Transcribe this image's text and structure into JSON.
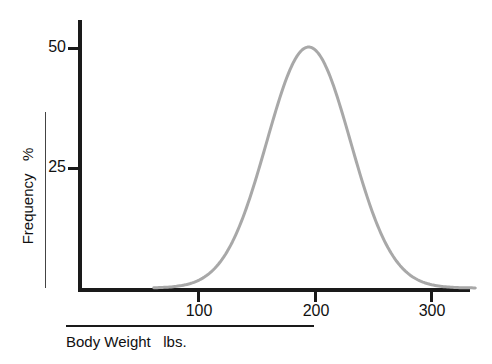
{
  "chart_data": {
    "type": "line",
    "title": "",
    "subtitle": "",
    "xlabel": "Body Weight   lbs.",
    "ylabel": "Frequency   %",
    "xlim": [
      50,
      350
    ],
    "ylim": [
      0,
      56
    ],
    "xticks": [
      100,
      200,
      300
    ],
    "yticks": [
      25,
      50
    ],
    "xtick_labels": [
      "100",
      "200",
      "300"
    ],
    "ytick_labels": [
      "25",
      "50"
    ],
    "grid": false,
    "legend": false,
    "legend_position": "none",
    "annotations": [],
    "series": [
      {
        "name": "Body weight distribution",
        "color": "#a8a8a8",
        "linewidth": 3,
        "x": [
          70,
          80,
          90,
          100,
          110,
          120,
          130,
          140,
          150,
          160,
          170,
          180,
          190,
          200,
          210,
          220,
          230,
          240,
          250,
          260,
          270,
          280,
          290,
          300,
          310,
          320,
          330
        ],
        "values": [
          0.1,
          0.4,
          1.2,
          3.0,
          6.3,
          11.4,
          18.1,
          25.7,
          33.4,
          40.3,
          45.6,
          48.8,
          50.0,
          50.0,
          48.8,
          45.6,
          40.3,
          33.4,
          25.7,
          18.1,
          11.4,
          6.3,
          3.0,
          1.2,
          0.4,
          0.1,
          0.0
        ]
      }
    ]
  },
  "axes": {
    "y_ticks": [
      {
        "label": "50",
        "value": 50
      },
      {
        "label": "25",
        "value": 25
      }
    ],
    "x_ticks": [
      {
        "label": "100",
        "value": 100
      },
      {
        "label": "200",
        "value": 200
      },
      {
        "label": "300",
        "value": 300
      }
    ],
    "y_axis_title": "Frequency   %",
    "x_axis_title": "Body Weight   lbs."
  },
  "colors": {
    "axis": "#1a1a1a",
    "curve": "#a8a8a8",
    "text": "#111111",
    "background": "#ffffff",
    "rule": "#444444"
  }
}
